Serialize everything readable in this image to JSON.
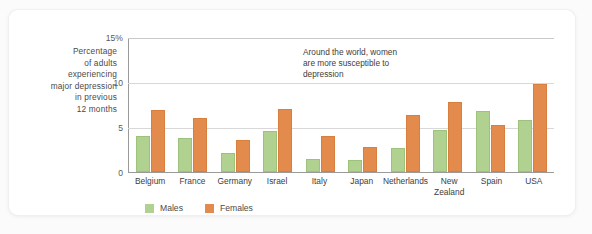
{
  "chart_data": {
    "type": "bar",
    "title": "",
    "subtitle": "",
    "xlabel": "",
    "ylabel": "Percentage of adults experiencing major depression in previous 12 months",
    "ylabel_lines": [
      "Percentage",
      "of adults",
      "experiencing",
      "major depression",
      "in previous",
      "12 months"
    ],
    "ylim": [
      0,
      15
    ],
    "yticks": [
      0,
      5,
      10,
      15
    ],
    "ytick_labels": [
      "0",
      "5",
      "10",
      "15%"
    ],
    "grid": "horizontal",
    "legend_position": "bottom-left",
    "annotations": [
      {
        "text": "Around the world, women are more susceptible to depression",
        "lines": [
          "Around the world, women",
          "are more susceptible to",
          "depression"
        ]
      }
    ],
    "categories": [
      "Belgium",
      "France",
      "Germany",
      "Israel",
      "Italy",
      "Japan",
      "Netherlands",
      "New Zealand",
      "Spain",
      "USA"
    ],
    "category_label_lines": [
      [
        "Belgium"
      ],
      [
        "France"
      ],
      [
        "Germany"
      ],
      [
        "Israel"
      ],
      [
        "Italy"
      ],
      [
        "Japan"
      ],
      [
        "Netherlands"
      ],
      [
        "New",
        "Zealand"
      ],
      [
        "Spain"
      ],
      [
        "USA"
      ]
    ],
    "series": [
      {
        "name": "Males",
        "color": "#b1d191",
        "values": [
          4.0,
          3.8,
          2.1,
          4.6,
          1.5,
          1.4,
          2.7,
          4.7,
          6.8,
          5.8
        ]
      },
      {
        "name": "Females",
        "color": "#e28b4c",
        "values": [
          6.9,
          6.0,
          3.6,
          7.1,
          4.0,
          2.8,
          6.4,
          7.8,
          5.3,
          9.8
        ]
      }
    ]
  },
  "colors": {
    "males": "#b1d191",
    "females": "#e28b4c",
    "axis": "#9a9a9a",
    "gridline": "#d8d8d8",
    "text": "#3d3d3d",
    "card": "#ffffff",
    "page": "#fbfbfb"
  }
}
